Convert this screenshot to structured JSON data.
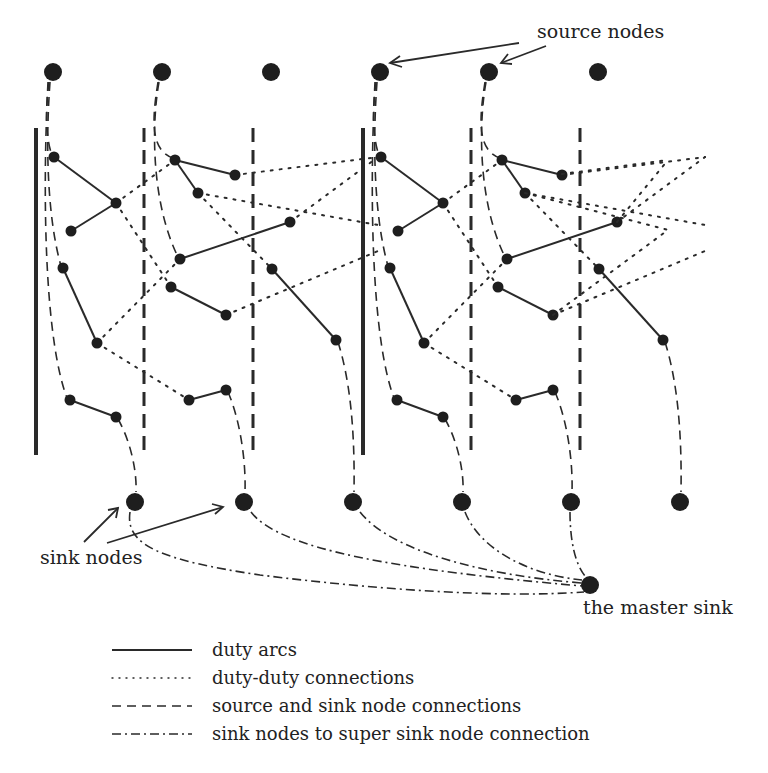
{
  "labels": {
    "source_nodes": "source nodes",
    "sink_nodes": "sink nodes",
    "master_sink": "the master sink"
  },
  "legend": [
    {
      "style": "solid",
      "label": "duty arcs"
    },
    {
      "style": "dotted",
      "label": "duty-duty connections"
    },
    {
      "style": "dashed",
      "label": "source and sink node connections"
    },
    {
      "style": "dash-dot",
      "label": "sink nodes to super sink node connection"
    }
  ],
  "diagram": {
    "source_node_count": 6,
    "sink_node_count": 6,
    "master_sink_count": 1,
    "colors": {
      "ink": "#1e1e1e",
      "background": "#ffffff"
    }
  }
}
